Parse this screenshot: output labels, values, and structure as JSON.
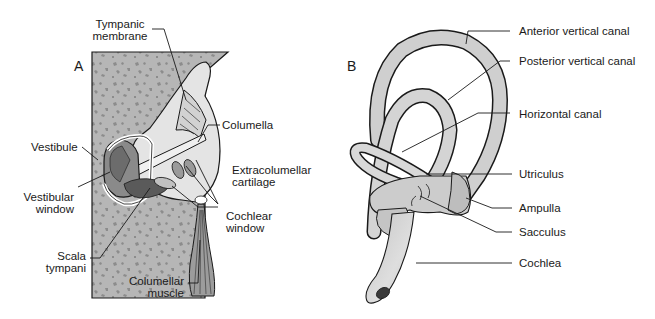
{
  "figure": {
    "panels": [
      {
        "letter": "A",
        "description": "Cross-section of middle and inner ear region embedded in bone",
        "labels": {
          "tympanic_membrane": [
            "Tympanic",
            "membrane"
          ],
          "columella": [
            "Columella"
          ],
          "vestibule": [
            "Vestibule"
          ],
          "extracolumellar_cartilage": [
            "Extracolumellar",
            "cartilage"
          ],
          "vestibular_window": [
            "Vestibular",
            "window"
          ],
          "cochlear_window": [
            "Cochlear",
            "window"
          ],
          "scala_tympani": [
            "Scala",
            "tympani"
          ],
          "columellar_muscle": [
            "Columellar",
            "muscle"
          ]
        }
      },
      {
        "letter": "B",
        "description": "Membranous labyrinth of the inner ear",
        "labels": {
          "anterior_vertical_canal": "Anterior vertical canal",
          "posterior_vertical_canal": "Posterior vertical canal",
          "horizontal_canal": "Horizontal canal",
          "utriculus": "Utriculus",
          "ampulla": "Ampulla",
          "sacculus": "Sacculus",
          "cochlea": "Cochlea"
        }
      }
    ],
    "colors": {
      "bone_fill": "#b4b4b4",
      "bone_speckle": "#8e8e8e",
      "tissue_fill": "#d6d6d6",
      "canal_fill": "#cfcfcf",
      "stroke": "#1a1a1a",
      "background": "#ffffff"
    }
  }
}
